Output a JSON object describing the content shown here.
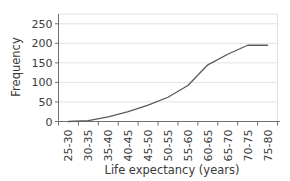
{
  "chart_data": {
    "type": "line",
    "title": "",
    "xlabel": "Life expectancy (years)",
    "ylabel": "Frequency",
    "categories": [
      "25-30",
      "30-35",
      "35-40",
      "40-45",
      "45-50",
      "50-55",
      "55-60",
      "60-65",
      "65-70",
      "70-75",
      "75-80"
    ],
    "values": [
      0,
      2,
      12,
      25,
      42,
      62,
      92,
      145,
      172,
      195,
      195
    ],
    "series": [
      {
        "name": "Cumulative frequency",
        "values": [
          0,
          2,
          12,
          25,
          42,
          62,
          92,
          145,
          172,
          195,
          195
        ]
      }
    ],
    "yticks": [
      0,
      50,
      100,
      150,
      200,
      250
    ],
    "ytick_labels": [
      "0",
      "50",
      "100",
      "150",
      "200",
      "250"
    ],
    "ylim": [
      0,
      275
    ],
    "grid": "horizontal",
    "legend": "none",
    "line_color": "#595959",
    "grid_color": "#e2e2e2",
    "axis_color": "#6e6e6e",
    "background": "#ffffff"
  },
  "axes": {
    "y_title": "Frequency",
    "x_title": "Life expectancy (years)"
  }
}
